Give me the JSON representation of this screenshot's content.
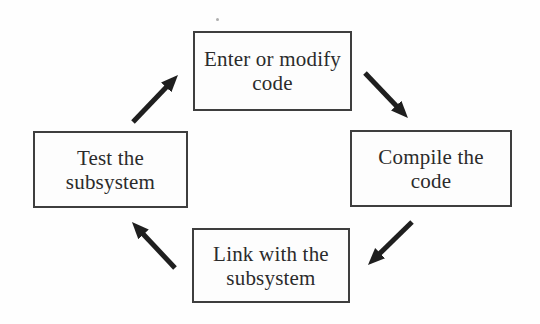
{
  "diagram": {
    "type": "cycle",
    "colors": {
      "background": "#fefefe",
      "box_border": "#3e3e3e",
      "text": "#2b2b2b",
      "arrow": "#1f1f1f"
    },
    "nodes": [
      {
        "id": "enter-or-modify-code",
        "position": "top",
        "lines": [
          "Enter or modify",
          "code"
        ]
      },
      {
        "id": "compile-the-code",
        "position": "right",
        "lines": [
          "Compile the",
          "code"
        ]
      },
      {
        "id": "link-with-the-subsystem",
        "position": "bottom",
        "lines": [
          "Link with the",
          "subsystem"
        ]
      },
      {
        "id": "test-the-subsystem",
        "position": "left",
        "lines": [
          "Test the",
          "subsystem"
        ]
      }
    ],
    "edges": [
      {
        "from": "test-the-subsystem",
        "to": "enter-or-modify-code",
        "direction": "up-right"
      },
      {
        "from": "enter-or-modify-code",
        "to": "compile-the-code",
        "direction": "down-right"
      },
      {
        "from": "compile-the-code",
        "to": "link-with-the-subsystem",
        "direction": "down-left"
      },
      {
        "from": "link-with-the-subsystem",
        "to": "test-the-subsystem",
        "direction": "up-left"
      }
    ]
  }
}
